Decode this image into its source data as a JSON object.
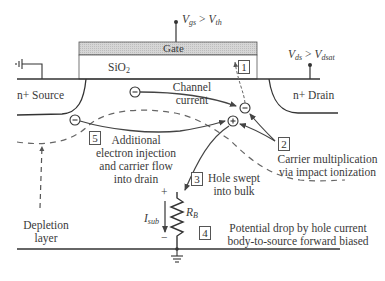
{
  "diagram": {
    "terminals": {
      "gate_bias": {
        "v": "V",
        "sub1": "gs",
        "op": " > ",
        "v2": "V",
        "sub2": "th"
      },
      "drain_bias": {
        "v": "V",
        "sub1": "ds",
        "op": " > ",
        "v2": "V",
        "sub2": "dsat"
      }
    },
    "regions": {
      "gate": "Gate",
      "oxide": "SiO",
      "oxide_sub": "2",
      "source": "n+ Source",
      "drain": "n+ Drain",
      "depletion_line1": "Depletion",
      "depletion_line2": "layer"
    },
    "labels": {
      "channel_current_line1": "Channel",
      "channel_current_line2": "current",
      "electron_symbol": "−",
      "hole_symbol": "+",
      "resistor": "R",
      "resistor_sub": "B",
      "current": "I",
      "current_sub": "sub",
      "plus": "+",
      "minus": "−"
    },
    "steps": [
      {
        "num": "1",
        "text": ""
      },
      {
        "num": "2",
        "line1": "Carrier multiplication",
        "line2": "via impact ionization"
      },
      {
        "num": "3",
        "line1": "Hole swept",
        "line2": "into bulk"
      },
      {
        "num": "4",
        "line1": "Potential drop by hole current",
        "line2": "body-to-source forward biased"
      },
      {
        "num": "5",
        "line1": "Additional",
        "line2": "electron injection",
        "line3": "and carrier flow",
        "line4": "into drain"
      }
    ],
    "colors": {
      "line": "#333333",
      "gate_fill": "#cfcfcf",
      "dashed": "#666666",
      "text": "#3a3a3a"
    }
  }
}
